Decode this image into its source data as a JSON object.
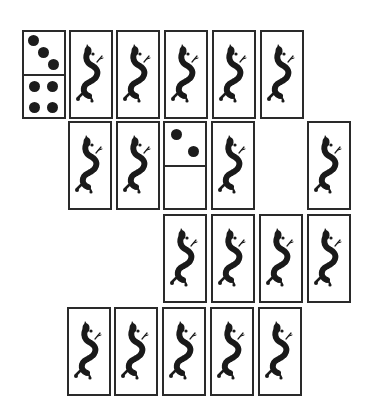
{
  "game": {
    "type": "domino-solitaire",
    "colors": {
      "border": "#2a2a2a",
      "pip": "#1c1c1c",
      "dragon": "#1a1a1a",
      "background": "#ffffff"
    },
    "tiles": [
      {
        "id": "r1c1",
        "x": 22,
        "y": 30,
        "face": "domino",
        "top": 3,
        "bottom": 4
      },
      {
        "id": "r1c2",
        "x": 69,
        "y": 30,
        "face": "dragon-back"
      },
      {
        "id": "r1c3",
        "x": 116,
        "y": 30,
        "face": "dragon-back"
      },
      {
        "id": "r1c4",
        "x": 164,
        "y": 30,
        "face": "dragon-back"
      },
      {
        "id": "r1c5",
        "x": 212,
        "y": 30,
        "face": "dragon-back"
      },
      {
        "id": "r1c6",
        "x": 260,
        "y": 30,
        "face": "dragon-back"
      },
      {
        "id": "r2c2",
        "x": 68,
        "y": 121,
        "face": "dragon-back"
      },
      {
        "id": "r2c3",
        "x": 116,
        "y": 121,
        "face": "dragon-back"
      },
      {
        "id": "r2c4",
        "x": 163,
        "y": 121,
        "face": "domino",
        "top": 2,
        "bottom": 0
      },
      {
        "id": "r2c5",
        "x": 211,
        "y": 121,
        "face": "dragon-back"
      },
      {
        "id": "r2c7",
        "x": 307,
        "y": 121,
        "face": "dragon-back"
      },
      {
        "id": "r3c4",
        "x": 163,
        "y": 214,
        "face": "dragon-back"
      },
      {
        "id": "r3c5",
        "x": 211,
        "y": 214,
        "face": "dragon-back"
      },
      {
        "id": "r3c6",
        "x": 259,
        "y": 214,
        "face": "dragon-back"
      },
      {
        "id": "r3c7",
        "x": 307,
        "y": 214,
        "face": "dragon-back"
      },
      {
        "id": "r4c2",
        "x": 67,
        "y": 307,
        "face": "dragon-back"
      },
      {
        "id": "r4c3",
        "x": 114,
        "y": 307,
        "face": "dragon-back"
      },
      {
        "id": "r4c4",
        "x": 162,
        "y": 307,
        "face": "dragon-back"
      },
      {
        "id": "r4c5",
        "x": 210,
        "y": 307,
        "face": "dragon-back"
      },
      {
        "id": "r4c6",
        "x": 258,
        "y": 307,
        "face": "dragon-back"
      }
    ]
  }
}
